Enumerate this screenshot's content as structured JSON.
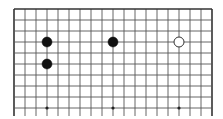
{
  "board": {
    "type": "go",
    "columns": 19,
    "visible_rows": 10,
    "origin_x": 14,
    "origin_y": 9,
    "spacing": 11,
    "line_color": "#555555",
    "border_color": "#333333",
    "background": "#ffffff",
    "open_bottom": true,
    "line_bottom_y": 116,
    "stone_radius": 5,
    "star_points": [
      {
        "col": 3,
        "row": 9
      },
      {
        "col": 9,
        "row": 9
      },
      {
        "col": 15,
        "row": 9
      }
    ],
    "stones": [
      {
        "color": "black",
        "col": 3,
        "row": 3
      },
      {
        "color": "black",
        "col": 9,
        "row": 3
      },
      {
        "color": "white",
        "col": 15,
        "row": 3
      },
      {
        "color": "black",
        "col": 3,
        "row": 5
      }
    ]
  }
}
